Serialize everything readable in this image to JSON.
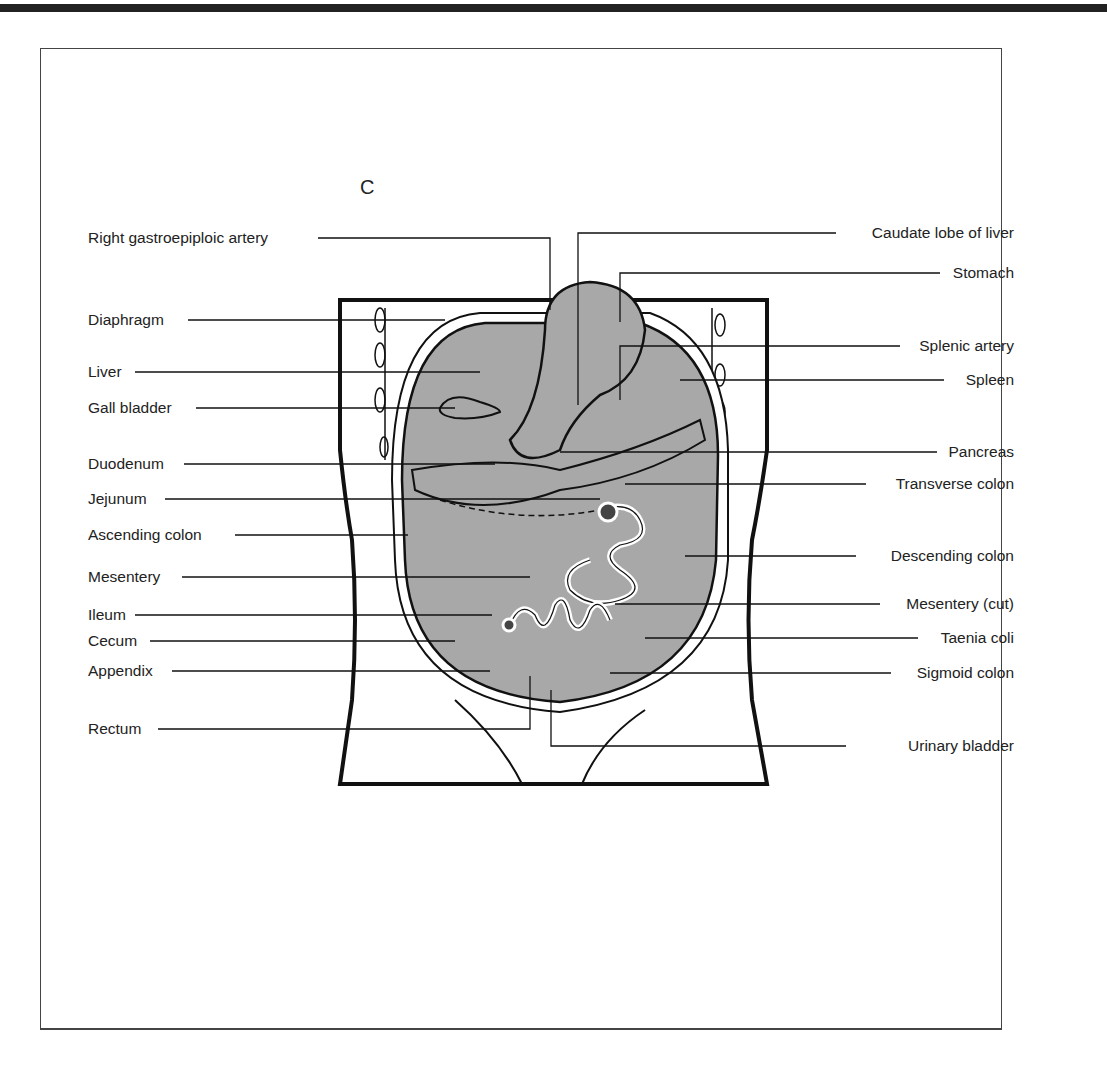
{
  "figure": {
    "panel_letter": "C",
    "labels_left": [
      {
        "id": "right-gastroepiploic-artery",
        "text": "Right gastroepiploic artery",
        "y": 238
      },
      {
        "id": "diaphragm",
        "text": "Diaphragm",
        "y": 320
      },
      {
        "id": "liver",
        "text": "Liver",
        "y": 372
      },
      {
        "id": "gall-bladder",
        "text": "Gall bladder",
        "y": 408
      },
      {
        "id": "duodenum",
        "text": "Duodenum",
        "y": 464
      },
      {
        "id": "jejunum",
        "text": "Jejunum",
        "y": 499
      },
      {
        "id": "ascending-colon",
        "text": "Ascending colon",
        "y": 535
      },
      {
        "id": "mesentery",
        "text": "Mesentery",
        "y": 577
      },
      {
        "id": "ileum",
        "text": "Ileum",
        "y": 615
      },
      {
        "id": "cecum",
        "text": "Cecum",
        "y": 641
      },
      {
        "id": "appendix",
        "text": "Appendix",
        "y": 671
      },
      {
        "id": "rectum",
        "text": "Rectum",
        "y": 729
      }
    ],
    "labels_right": [
      {
        "id": "caudate-lobe-of-liver",
        "text": "Caudate lobe of liver",
        "y": 233
      },
      {
        "id": "stomach",
        "text": "Stomach",
        "y": 273
      },
      {
        "id": "splenic-artery",
        "text": "Splenic artery",
        "y": 346
      },
      {
        "id": "spleen",
        "text": "Spleen",
        "y": 380
      },
      {
        "id": "pancreas",
        "text": "Pancreas",
        "y": 452
      },
      {
        "id": "transverse-colon",
        "text": "Transverse colon",
        "y": 484
      },
      {
        "id": "descending-colon",
        "text": "Descending colon",
        "y": 556
      },
      {
        "id": "mesentery-cut",
        "text": "Mesentery (cut)",
        "y": 604
      },
      {
        "id": "taenia-coli",
        "text": "Taenia coli",
        "y": 638
      },
      {
        "id": "sigmoid-colon",
        "text": "Sigmoid colon",
        "y": 673
      },
      {
        "id": "urinary-bladder",
        "text": "Urinary bladder",
        "y": 746
      }
    ]
  }
}
